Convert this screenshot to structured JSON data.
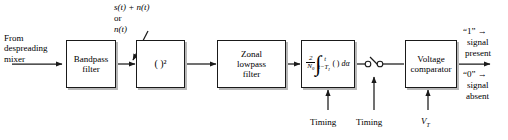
{
  "diagram": {
    "background": "#ffffff",
    "line_color": "#1a1a1a",
    "shadow_color": "#b8b8b8"
  },
  "input": {
    "source_label": "From\ndespreading\nmixer"
  },
  "annotations": {
    "signal_plus_noise": "s(t) + n(t)",
    "or": "or",
    "noise_only": "n(t)"
  },
  "blocks": [
    {
      "id": "bandpass-filter",
      "label": "Bandpass\nfilter"
    },
    {
      "id": "squarer",
      "label": "( )²"
    },
    {
      "id": "zonal-lowpass-filter",
      "label": "Zonal\nlowpass\nfilter"
    },
    {
      "id": "integrator",
      "label": "2/N₀ ∫ from t−T_I to t ( ) dα",
      "gain_numerator": "2",
      "gain_denominator": "N0",
      "integral_upper_limit": "t",
      "integral_lower_limit": "t − T_I",
      "integrand": "( ) dα"
    },
    {
      "id": "voltage-comparator",
      "label": "Voltage\ncomparator"
    }
  ],
  "sampler": {
    "id": "sampling-switch",
    "label": ""
  },
  "control_inputs": [
    {
      "id": "timing-integrator",
      "label": "Timing"
    },
    {
      "id": "timing-sampler",
      "label": "Timing"
    },
    {
      "id": "threshold-voltage",
      "label": "VT",
      "symbol": "V",
      "subscript": "T"
    }
  ],
  "outputs": {
    "one_decision": "“1” →",
    "one_meaning_line1": "signal",
    "one_meaning_line2": "present",
    "zero_decision": "“0” →",
    "zero_meaning_line1": "signal",
    "zero_meaning_line2": "absent"
  }
}
